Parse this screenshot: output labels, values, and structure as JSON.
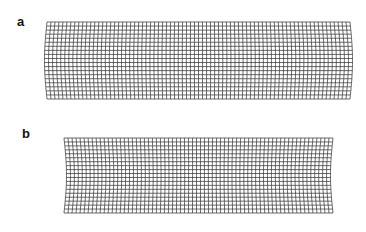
{
  "figure": {
    "panels": [
      {
        "label": "a",
        "label_pos": [
          17,
          15
        ],
        "grid": {
          "left": 47,
          "right": 350,
          "top": 22,
          "bottom": 99,
          "cols": 76,
          "rows": 19,
          "bulge": 2.5,
          "bulge_dir": "outward"
        }
      },
      {
        "label": "b",
        "label_pos": [
          22,
          127
        ],
        "grid": {
          "left": 64,
          "right": 333,
          "top": 138,
          "bottom": 213,
          "cols": 67,
          "rows": 19,
          "bulge": 2.5,
          "bulge_dir": "inward"
        }
      }
    ],
    "line_color": "#3a3a3a",
    "background": "#ffffff"
  }
}
